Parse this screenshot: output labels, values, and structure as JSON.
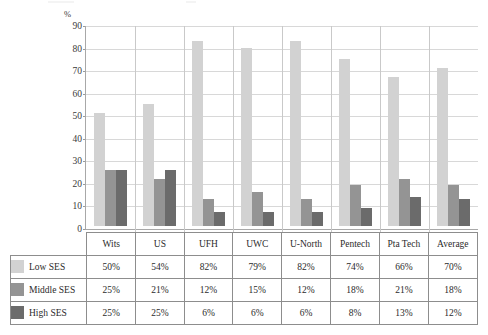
{
  "chart_data": {
    "type": "bar",
    "title": "",
    "xlabel": "",
    "ylabel": "%",
    "ylim": [
      0,
      90
    ],
    "yticks": [
      0,
      10,
      20,
      30,
      40,
      50,
      60,
      70,
      80,
      90
    ],
    "grid": true,
    "legend_position": "table-below",
    "categories": [
      "Wits",
      "US",
      "UFH",
      "UWC",
      "U-North",
      "Pentech",
      "Pta Tech",
      "Average"
    ],
    "series": [
      {
        "name": "Low SES",
        "color": "#d2d2d2",
        "values": [
          50,
          54,
          82,
          79,
          82,
          74,
          66,
          70
        ]
      },
      {
        "name": "Middle SES",
        "color": "#949494",
        "values": [
          25,
          21,
          12,
          15,
          12,
          18,
          21,
          18
        ]
      },
      {
        "name": "High SES",
        "color": "#6b6b6b",
        "values": [
          25,
          25,
          6,
          6,
          6,
          8,
          13,
          12
        ]
      }
    ]
  },
  "table": {
    "corner_label": "",
    "headers": [
      "Wits",
      "US",
      "UFH",
      "UWC",
      "U-North",
      "Pentech",
      "Pta Tech",
      "Average"
    ],
    "rows": [
      {
        "label": "Low SES",
        "swatch": "low-ses-swatch",
        "values": [
          "50%",
          "54%",
          "82%",
          "79%",
          "82%",
          "74%",
          "66%",
          "70%"
        ]
      },
      {
        "label": "Middle SES",
        "swatch": "middle-ses-swatch",
        "values": [
          "25%",
          "21%",
          "12%",
          "15%",
          "12%",
          "18%",
          "21%",
          "18%"
        ]
      },
      {
        "label": "High SES",
        "swatch": "high-ses-swatch",
        "values": [
          "25%",
          "25%",
          "6%",
          "6%",
          "6%",
          "8%",
          "13%",
          "12%"
        ]
      }
    ]
  },
  "axis": {
    "unit_label": "%",
    "ticks": [
      "90",
      "80",
      "70",
      "60",
      "50",
      "40",
      "30",
      "20",
      "10",
      "0"
    ]
  }
}
